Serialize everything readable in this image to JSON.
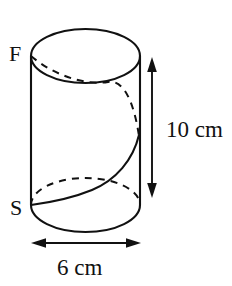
{
  "figure": {
    "kind": "cylinder-with-helix-diagram",
    "background_color": "#ffffff",
    "line_color": "#111111",
    "labels": {
      "start_point": "S",
      "finish_point": "F",
      "height_dimension": "10 cm",
      "diameter_dimension": "6 cm"
    },
    "measurements": {
      "height_value": 10,
      "height_unit": "cm",
      "diameter_value": 6,
      "diameter_unit": "cm"
    },
    "geometry": {
      "cylinder_left_x": 31,
      "cylinder_right_x": 140,
      "top_ellipse_cy": 56,
      "bottom_ellipse_cy": 205,
      "ellipse_rx": 54.5,
      "ellipse_ry": 27,
      "helix_start": "S",
      "helix_end": "F",
      "helix_turns": 1
    }
  }
}
